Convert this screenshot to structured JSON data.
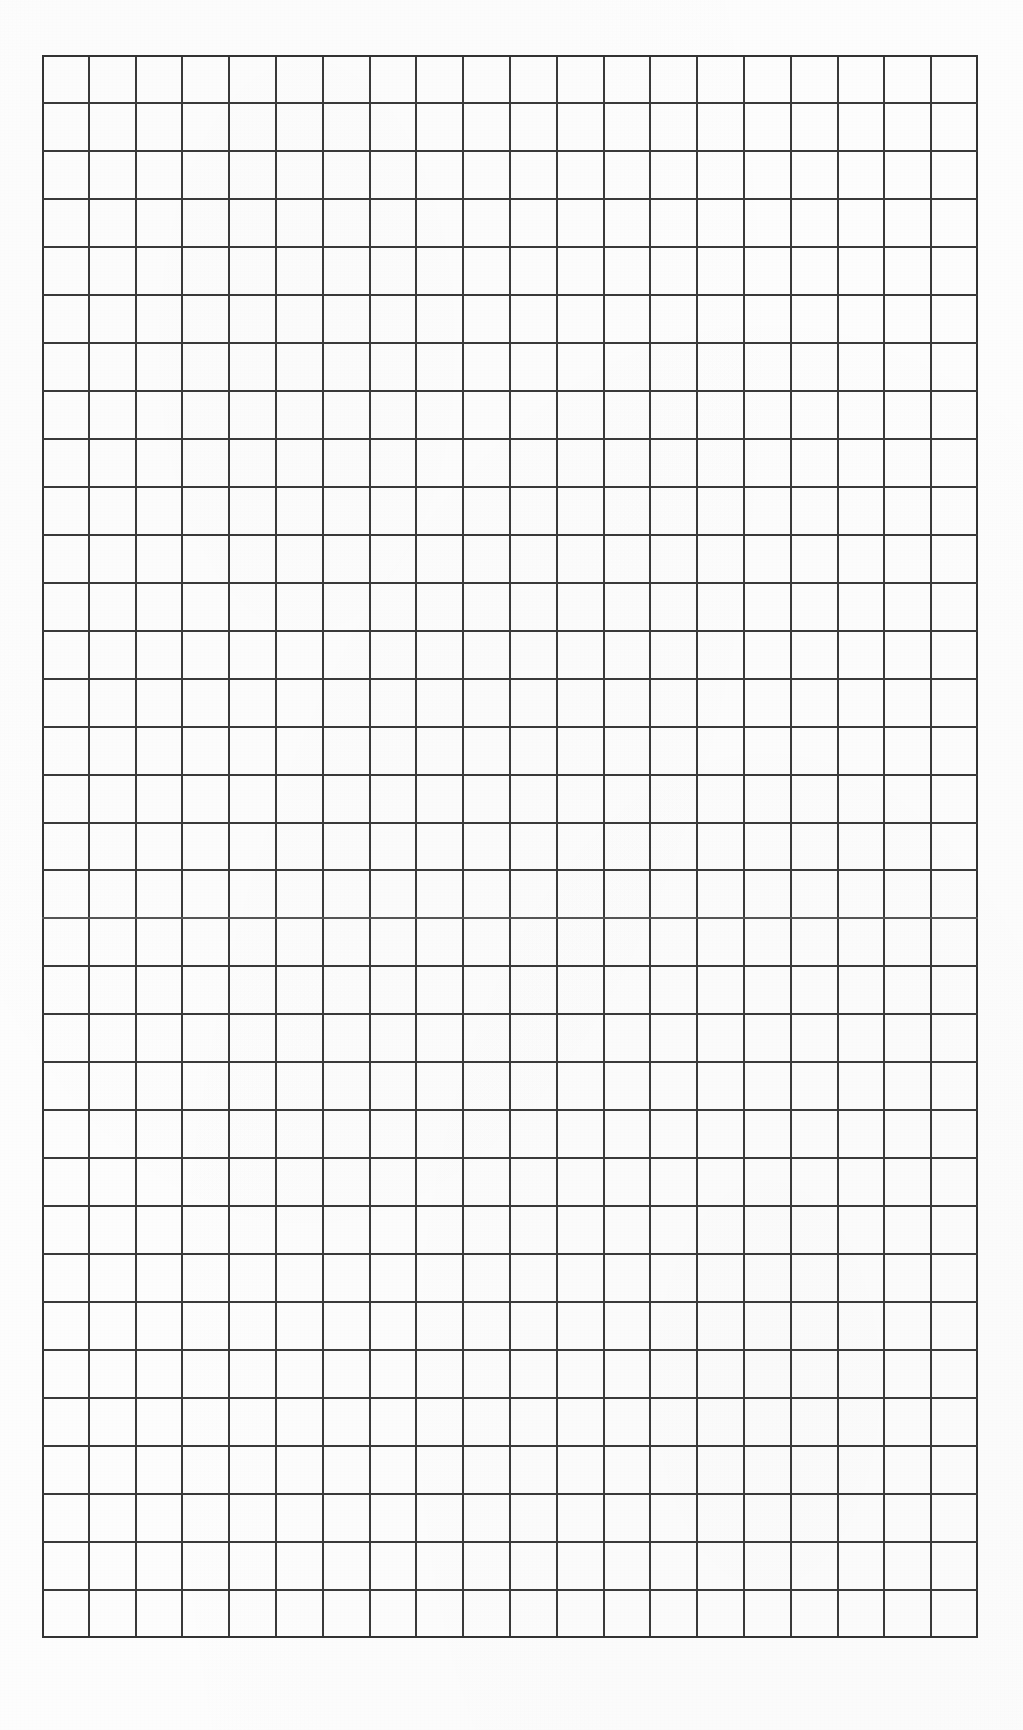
{
  "document": {
    "kind": "scanned-grid-paper",
    "canvas_width": 1023,
    "canvas_height": 1730,
    "background_color": "#fdfdfd",
    "caption": ""
  },
  "grid": {
    "name": "graph-paper-grid",
    "origin_x": 42,
    "origin_y": 55,
    "width": 936,
    "height": 1583,
    "columns": 20,
    "rows": 33,
    "cell_width": 46.8,
    "cell_height": 47.97,
    "line_color": "#3a3a3a",
    "border_color": "#333333",
    "line_width": 2,
    "border_width": 2.2,
    "faint_row_index": 18,
    "faint_line_color": "#555555",
    "faint_line_width": 1.5
  },
  "chart_data": {
    "type": "table",
    "title": "",
    "subtitle": "",
    "xlabel": "",
    "ylabel": "",
    "columns": 20,
    "rows": 33,
    "grid": true,
    "legend": "none",
    "cell_values": [],
    "annotations": []
  }
}
